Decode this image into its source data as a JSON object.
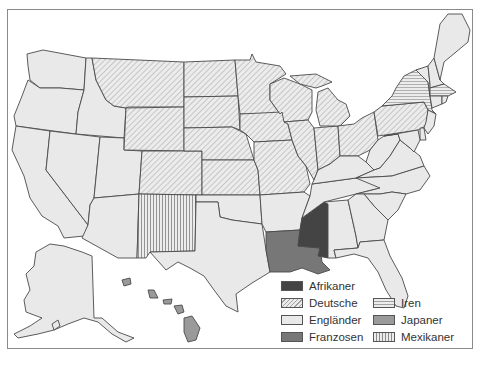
{
  "map": {
    "title": "",
    "subject": "Größte Abstammungsgruppe je US-Bundesstaat",
    "colors": {
      "background": "#ffffff",
      "land": "#e9e9e9",
      "border": "#4a4a4a",
      "afrikaner": "#444444",
      "franzosen": "#777777",
      "japaner": "#9a9a9a",
      "hatch_line": "#9a9a9a"
    },
    "categories": [
      {
        "key": "afrikaner",
        "label": "Afrikaner",
        "fill": "solid-dark"
      },
      {
        "key": "deutsche",
        "label": "Deutsche",
        "fill": "diagonal-hatch"
      },
      {
        "key": "englaender",
        "label": "Engländer",
        "fill": "light-solid"
      },
      {
        "key": "franzosen",
        "label": "Franzosen",
        "fill": "solid-medium"
      },
      {
        "key": "iren",
        "label": "Iren",
        "fill": "horizontal-lines"
      },
      {
        "key": "japaner",
        "label": "Japaner",
        "fill": "solid-gray"
      },
      {
        "key": "mexikaner",
        "label": "Mexikaner",
        "fill": "vertical-lines"
      }
    ],
    "states": {
      "afrikaner": [
        "Mississippi"
      ],
      "deutsche": [
        "Montana",
        "Wyoming",
        "Colorado",
        "North Dakota",
        "South Dakota",
        "Nebraska",
        "Kansas",
        "Minnesota",
        "Iowa",
        "Missouri",
        "Wisconsin",
        "Illinois",
        "Indiana",
        "Michigan",
        "Ohio",
        "Pennsylvania"
      ],
      "englaender": [
        "Washington",
        "Oregon",
        "California",
        "Idaho",
        "Nevada",
        "Utah",
        "Arizona",
        "Oklahoma",
        "Texas",
        "Arkansas",
        "Tennessee",
        "Kentucky",
        "West Virginia",
        "Virginia",
        "North Carolina",
        "South Carolina",
        "Georgia",
        "Alabama",
        "Florida",
        "Maine",
        "New Hampshire",
        "Vermont",
        "Connecticut",
        "Rhode Island",
        "New Jersey",
        "Delaware",
        "Maryland",
        "Alaska"
      ],
      "franzosen": [
        "Louisiana"
      ],
      "iren": [
        "New York",
        "Massachusetts"
      ],
      "japaner": [
        "Hawaii"
      ],
      "mexikaner": [
        "New Mexico"
      ]
    }
  },
  "legend": {
    "items": [
      {
        "label": "Afrikaner"
      },
      {
        "label": "Deutsche"
      },
      {
        "label": "Engländer"
      },
      {
        "label": "Franzosen"
      },
      {
        "label": "Iren"
      },
      {
        "label": "Japaner"
      },
      {
        "label": "Mexikaner"
      }
    ]
  }
}
